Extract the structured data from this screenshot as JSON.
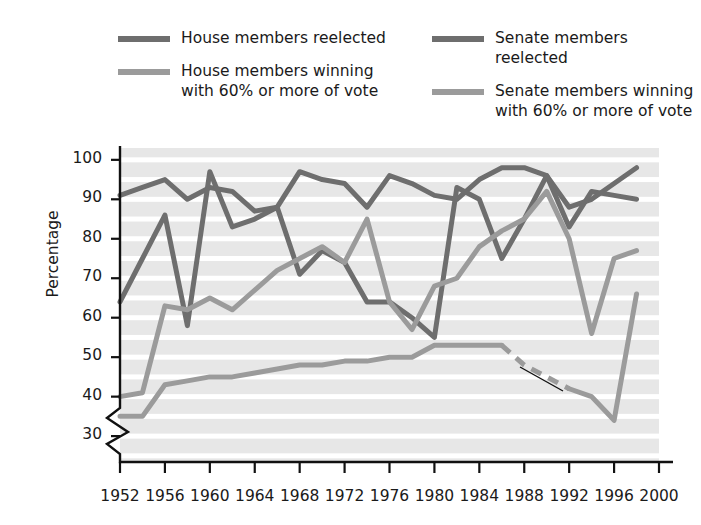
{
  "legend": {
    "left_column": [
      {
        "label": "House members reelected",
        "color": "#6e6e6e",
        "key": "house-reelected"
      },
      {
        "label": "House members winning\nwith 60% or more of vote",
        "color": "#9b9b9b",
        "key": "house-60"
      }
    ],
    "right_column": [
      {
        "label": "Senate members reelected",
        "color": "#6e6e6e",
        "key": "senate-reelected"
      },
      {
        "label": "Senate members winning\nwith 60% or more of vote",
        "color": "#9b9b9b",
        "key": "senate-60"
      }
    ]
  },
  "axes": {
    "ylabel": "Percentage",
    "yticks": [
      30,
      40,
      50,
      60,
      70,
      80,
      90,
      100
    ],
    "xticks": [
      1952,
      1956,
      1960,
      1964,
      1968,
      1972,
      1976,
      1980,
      1984,
      1988,
      1992,
      1996,
      2000
    ],
    "axis_break": true,
    "plot_bg": "#e7e7e7",
    "gridline_color": "#ffffff"
  },
  "annotation": {
    "text": "Data unavailable\nfrom 1986 to 1992"
  },
  "chart_data": {
    "type": "line",
    "title": "",
    "xlabel": "",
    "ylabel": "Percentage",
    "xlim": [
      1952,
      2000
    ],
    "ylim": [
      28,
      103
    ],
    "yticks": [
      30,
      40,
      50,
      60,
      70,
      80,
      90,
      100
    ],
    "xticks": [
      1952,
      1956,
      1960,
      1964,
      1968,
      1972,
      1976,
      1980,
      1984,
      1988,
      1992,
      1996,
      1998,
      2000
    ],
    "grid": "horizontal white bands every 5 percentage points",
    "legend_position": "above plot, two columns",
    "x": [
      1952,
      1954,
      1956,
      1958,
      1960,
      1962,
      1964,
      1966,
      1968,
      1970,
      1972,
      1974,
      1976,
      1978,
      1980,
      1982,
      1984,
      1986,
      1988,
      1990,
      1992,
      1994,
      1996,
      1998
    ],
    "series": [
      {
        "name": "House members reelected",
        "color": "#6e6e6e",
        "style": "solid",
        "values": [
          91,
          93,
          95,
          90,
          93,
          92,
          87,
          88,
          97,
          95,
          94,
          88,
          96,
          94,
          91,
          90,
          95,
          98,
          98,
          96,
          88,
          90,
          94,
          98
        ]
      },
      {
        "name": "House members winning with 60% or more of vote",
        "color": "#9b9b9b",
        "style": "solid",
        "values": [
          35,
          35,
          43,
          44,
          45,
          45,
          46,
          47,
          48,
          48,
          49,
          49,
          50,
          50,
          53,
          53,
          53,
          53,
          48,
          45,
          42,
          40,
          34,
          66
        ],
        "dashed_from": 1986,
        "dashed_to": 1992,
        "note": "Data unavailable from 1986 to 1992"
      },
      {
        "name": "Senate members reelected",
        "color": "#6e6e6e",
        "style": "solid",
        "values": [
          64,
          75,
          86,
          58,
          97,
          83,
          85,
          88,
          71,
          77,
          74,
          64,
          64,
          60,
          55,
          93,
          90,
          75,
          85,
          96,
          83,
          92,
          91,
          90
        ]
      },
      {
        "name": "Senate members winning with 60% or more of vote",
        "color": "#9b9b9b",
        "style": "solid",
        "values": [
          40,
          41,
          63,
          62,
          65,
          62,
          67,
          72,
          75,
          78,
          74,
          85,
          64,
          57,
          68,
          70,
          78,
          82,
          85,
          92,
          80,
          56,
          75,
          77
        ]
      }
    ]
  }
}
